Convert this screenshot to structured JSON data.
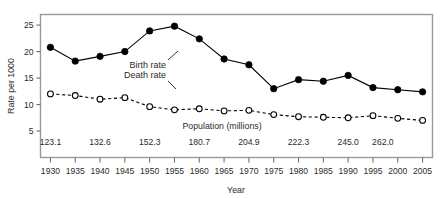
{
  "chart_data": {
    "type": "line",
    "title": "",
    "xlabel": "Year",
    "ylabel": "Rate per 1000",
    "xlim": [
      1928,
      2007
    ],
    "ylim": [
      0,
      27
    ],
    "grid": false,
    "legend_position": "inline-annotations",
    "x": [
      1930,
      1935,
      1940,
      1945,
      1950,
      1955,
      1960,
      1965,
      1970,
      1975,
      1980,
      1985,
      1990,
      1995,
      2000,
      2005
    ],
    "x_tick_labels": [
      "1930",
      "1935",
      "1940",
      "1945",
      "1950",
      "1955",
      "1960",
      "1965",
      "1970",
      "1975",
      "1980",
      "1985",
      "1990",
      "1995",
      "2000",
      "2005"
    ],
    "y_tick_labels": [
      "5",
      "10",
      "15",
      "20",
      "25"
    ],
    "y_ticks": [
      5,
      10,
      15,
      20,
      25
    ],
    "series": [
      {
        "name": "Birth rate",
        "marker": "filled-circle",
        "linestyle": "solid",
        "color": "#000000",
        "values": [
          20.8,
          18.2,
          19.1,
          20.0,
          23.9,
          24.8,
          22.4,
          18.6,
          17.5,
          13.0,
          14.7,
          14.4,
          15.5,
          13.2,
          12.8,
          12.4
        ]
      },
      {
        "name": "Death rate",
        "marker": "open-circle",
        "linestyle": "dashed",
        "color": "#000000",
        "values": [
          12.0,
          11.7,
          11.0,
          11.3,
          9.6,
          9.0,
          9.2,
          8.8,
          8.9,
          8.1,
          7.7,
          7.6,
          7.5,
          7.9,
          7.4,
          7.0
        ]
      }
    ],
    "annotations": [
      {
        "label": "Birth rate",
        "points_to_year": 1955
      },
      {
        "label": "Death rate",
        "points_to_year": 1955
      }
    ],
    "secondary_axis": {
      "title": "Population (millions)",
      "labels": [
        {
          "year": 1930,
          "value": "123.1"
        },
        {
          "year": 1940,
          "value": "132.6"
        },
        {
          "year": 1950,
          "value": "152.3"
        },
        {
          "year": 1960,
          "value": "180.7"
        },
        {
          "year": 1970,
          "value": "204.9"
        },
        {
          "year": 1980,
          "value": "222.3"
        },
        {
          "year": 1990,
          "value": "245.0"
        },
        {
          "year": 1997,
          "value": "262.0"
        }
      ]
    }
  },
  "style": {
    "frame_color": "#9a9a9a",
    "ink_color": "#1d1d1d",
    "background": "#ffffff"
  }
}
